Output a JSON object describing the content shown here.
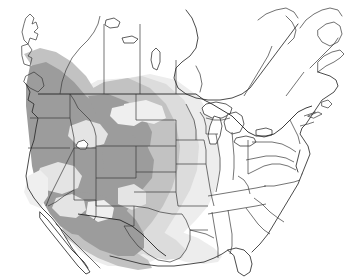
{
  "figure": {
    "kind": "distribution-map",
    "region": "North America",
    "title": "",
    "caption": "",
    "background_color": "#ffffff"
  },
  "canvas": {
    "width": 346,
    "height": 280
  },
  "palette": {
    "shade_dark": "#9c9c9c",
    "shade_mid": "#c2c2c2",
    "shade_light": "#dcdcdc",
    "shade_faint": "#ededed",
    "interior_gap": "#e4e4e4",
    "outline_dark": "#2b2b2b",
    "outline_state": "#3a3a3a",
    "water_fill": "#ffffff"
  },
  "legend": {
    "present": false,
    "entries": []
  },
  "labels": {
    "present": false,
    "items": []
  },
  "shading_classes": [
    {
      "name": "core-range",
      "color": "#9c9c9c",
      "description": "densest shading over western mountain states and northern Mexico"
    },
    {
      "name": "moderate-range",
      "color": "#c2c2c2",
      "description": "intermediate shading on range margins"
    },
    {
      "name": "peripheral-range",
      "color": "#dcdcdc",
      "description": "light shading across central plains"
    },
    {
      "name": "marginal-range",
      "color": "#ededed",
      "description": "faintest shading fading toward the east and Gulf coast"
    }
  ],
  "geography": {
    "nations": [
      "Canada",
      "United States",
      "Mexico"
    ],
    "water_bodies": [
      "Lake Superior",
      "Lake Michigan",
      "Lake Huron",
      "Lake Erie",
      "Lake Ontario",
      "Great Salt Lake",
      "Lake Winnipeg"
    ],
    "features_visible": [
      "Pacific coastline",
      "Atlantic coastline",
      "Gulf of Mexico",
      "Baja California peninsula",
      "Florida peninsula",
      "Great Lakes",
      "state boundaries",
      "provincial boundaries"
    ]
  }
}
